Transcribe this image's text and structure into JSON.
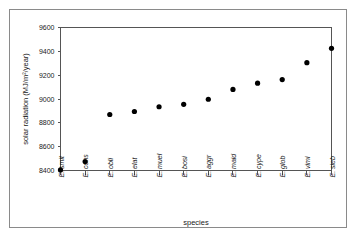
{
  "chart_data": {
    "type": "scatter",
    "title": "",
    "xlabel": "species",
    "ylabel": "solar radiation (MJ/m²/year)",
    "categories": [
      "E. smit",
      "E. cons",
      "E. obli",
      "E. elat",
      "E. muel",
      "E. bosi",
      "E. aggr",
      "E. maid",
      "E. cype",
      "E. glob",
      "E. vimi",
      "E. sieb"
    ],
    "values": [
      8405,
      8475,
      8870,
      8895,
      8935,
      8955,
      8998,
      9080,
      9133,
      9163,
      9305,
      9425
    ],
    "ylim": [
      8400,
      9600
    ],
    "ytick_labels": [
      "8400",
      "8600",
      "8800",
      "9000",
      "9200",
      "9400",
      "9600"
    ],
    "ytick_values": [
      8400,
      8600,
      8800,
      9000,
      9200,
      9400,
      9600
    ],
    "grid": false,
    "legend": false,
    "marker": "filled-circle",
    "marker_color": "#000000"
  },
  "axes": {
    "y_title": "solar radiation (MJ/m²/year)",
    "x_title": "species"
  }
}
